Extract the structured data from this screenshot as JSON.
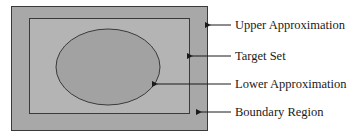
{
  "diagram": {
    "labels": {
      "upper": "Upper Approximation",
      "target": "Target Set",
      "lower": "Lower Approximation",
      "boundary": "Boundary Region"
    },
    "colors": {
      "outer_fill": "#a8a8a8",
      "inner_fill": "#b4b4b4",
      "ellipse_fill": "#a2a2a2",
      "stroke": "#3a3a3a"
    }
  }
}
